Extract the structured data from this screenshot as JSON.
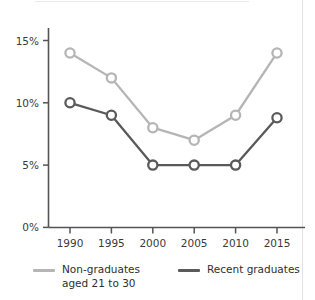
{
  "colors": {
    "series_light": "#b5b5b5",
    "series_dark": "#5a5a5a",
    "axis": "#545454",
    "text": "#2e2e2e",
    "background": "#ffffff",
    "panel_edge": "#e2e2e2"
  },
  "chart_data": {
    "type": "line",
    "title": "",
    "subtitle": "",
    "xlabel": "",
    "ylabel": "",
    "categories": [
      "1990",
      "1995",
      "2000",
      "2005",
      "2010",
      "2015"
    ],
    "x": [
      1990,
      1995,
      2000,
      2005,
      2010,
      2015
    ],
    "xlim": [
      1988,
      2017
    ],
    "ylim": [
      0,
      16
    ],
    "yticks": [
      0,
      5,
      10,
      15
    ],
    "ytick_labels": [
      "0%",
      "5%",
      "10%",
      "15%"
    ],
    "xtick_labels": [
      "1990",
      "1995",
      "2000",
      "2005",
      "2010",
      "2015"
    ],
    "grid": false,
    "legend_position": "bottom",
    "marker": "open-circle",
    "series": [
      {
        "name": "Non-graduates aged 21 to 30",
        "legend_label": "Non-graduates\naged 21 to 30",
        "color": "#b5b5b5",
        "values": [
          14,
          12,
          8,
          7,
          9,
          14
        ]
      },
      {
        "name": "Recent graduates",
        "legend_label": "Recent graduates",
        "color": "#5a5a5a",
        "values": [
          10,
          9,
          5,
          5,
          5,
          8.8
        ]
      }
    ]
  },
  "axes": {
    "y_tick_0": "0%",
    "y_tick_1": "5%",
    "y_tick_2": "10%",
    "y_tick_3": "15%",
    "x_tick_0": "1990",
    "x_tick_1": "1995",
    "x_tick_2": "2000",
    "x_tick_3": "2005",
    "x_tick_4": "2010",
    "x_tick_5": "2015"
  },
  "legend": {
    "items": [
      {
        "label": "Non-graduates\naged 21 to 30",
        "color": "#b5b5b5"
      },
      {
        "label": "Recent graduates",
        "color": "#5a5a5a"
      }
    ]
  }
}
